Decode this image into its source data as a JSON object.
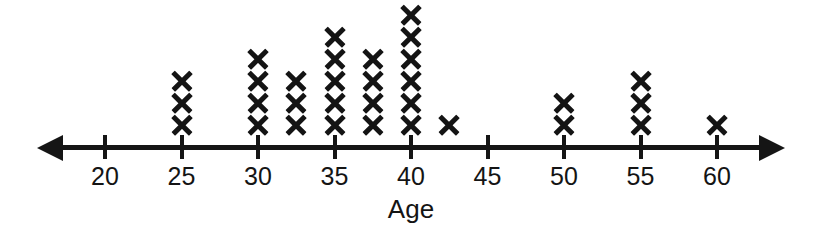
{
  "chart_data": {
    "type": "dotplot",
    "title": "",
    "xlabel": "Age",
    "ylabel": "",
    "marker": "X",
    "xlim": [
      18.5,
      62.5
    ],
    "grid": false,
    "legend": null,
    "axis_labeled_ticks": [
      20,
      25,
      30,
      35,
      40,
      45,
      50,
      55,
      60
    ],
    "tick_labels": [
      "20",
      "25",
      "30",
      "35",
      "40",
      "45",
      "50",
      "55",
      "60"
    ],
    "x": [
      25,
      30,
      32.5,
      35,
      37.5,
      40,
      42.5,
      50,
      55,
      60
    ],
    "counts": [
      3,
      4,
      3,
      5,
      4,
      6,
      1,
      2,
      3,
      1
    ],
    "total_count": 32,
    "categories": [
      "25",
      "30",
      "32.5",
      "35",
      "37.5",
      "40",
      "42.5",
      "50",
      "55",
      "60"
    ],
    "values": [
      3,
      4,
      3,
      5,
      4,
      6,
      1,
      2,
      3,
      1
    ],
    "stacks": [
      {
        "value": 25,
        "count": 3
      },
      {
        "value": 30,
        "count": 4
      },
      {
        "value": 32.5,
        "count": 3
      },
      {
        "value": 35,
        "count": 5
      },
      {
        "value": 37.5,
        "count": 4
      },
      {
        "value": 40,
        "count": 6
      },
      {
        "value": 42.5,
        "count": 1
      },
      {
        "value": 50,
        "count": 2
      },
      {
        "value": 55,
        "count": 3
      },
      {
        "value": 60,
        "count": 1
      }
    ],
    "colors": {
      "marker": "#141414",
      "axis": "#151515",
      "text": "#141414",
      "background": "#ffffff"
    }
  },
  "axis": {
    "title": "Age",
    "left_arrow": "left-arrowhead",
    "right_arrow": "right-arrowhead"
  }
}
